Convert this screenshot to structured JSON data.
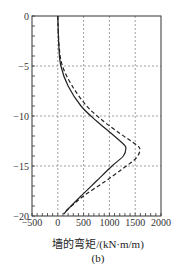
{
  "chart_data": {
    "type": "line",
    "title": "",
    "caption": "(b)",
    "xlabel": "墙的弯矩/(kN·m/m)",
    "ylabel": "",
    "xlim": [
      -500,
      2000
    ],
    "ylim": [
      -20,
      0
    ],
    "xticks": [
      -500,
      0,
      500,
      1000,
      1500,
      2000
    ],
    "yticks": [
      0,
      -5,
      -10,
      -15,
      -20
    ],
    "grid": "dashed",
    "legend": "none",
    "series": [
      {
        "name": "solid",
        "style": "solid",
        "points": [
          [
            0,
            0
          ],
          [
            20,
            -3
          ],
          [
            60,
            -5
          ],
          [
            200,
            -7
          ],
          [
            450,
            -9
          ],
          [
            750,
            -10.5
          ],
          [
            1050,
            -11.8
          ],
          [
            1270,
            -12.8
          ],
          [
            1320,
            -13.2
          ],
          [
            1270,
            -14
          ],
          [
            1050,
            -15
          ],
          [
            750,
            -16.5
          ],
          [
            450,
            -18
          ],
          [
            200,
            -19.3
          ],
          [
            120,
            -19.8
          ]
        ]
      },
      {
        "name": "dashed",
        "style": "dashed",
        "points": [
          [
            0,
            0
          ],
          [
            25,
            -3
          ],
          [
            90,
            -5
          ],
          [
            280,
            -7
          ],
          [
            560,
            -9
          ],
          [
            880,
            -10.5
          ],
          [
            1220,
            -11.8
          ],
          [
            1500,
            -12.8
          ],
          [
            1590,
            -13.3
          ],
          [
            1520,
            -14.2
          ],
          [
            1250,
            -15.3
          ],
          [
            900,
            -16.6
          ],
          [
            500,
            -18
          ],
          [
            200,
            -19.3
          ],
          [
            110,
            -19.8
          ]
        ]
      }
    ]
  }
}
